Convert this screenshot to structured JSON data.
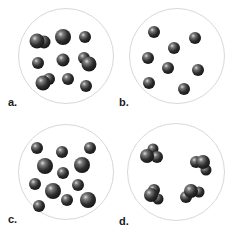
{
  "figure": {
    "colors": {
      "circle_border": "#d8d8d8",
      "atom_dark": "#1e1e1e",
      "atom_mid": "#555555",
      "atom_highlight": "#d9d9d9",
      "label": "#1a1a1a"
    },
    "panels": [
      {
        "id": "a",
        "label": "a.",
        "content": "mixture of single atoms and diatomic molecules",
        "circle": {
          "cx": 66,
          "cy": 56,
          "r": 48
        },
        "label_pos": {
          "x": 8,
          "y": 97
        },
        "particles": [
          {
            "x": 44,
            "y": 42,
            "r": 6.5
          },
          {
            "x": 37,
            "y": 41,
            "r": 7.5
          },
          {
            "x": 63,
            "y": 37,
            "r": 8
          },
          {
            "x": 85,
            "y": 37,
            "r": 6
          },
          {
            "x": 38,
            "y": 63,
            "r": 6
          },
          {
            "x": 63,
            "y": 60,
            "r": 6.5
          },
          {
            "x": 84,
            "y": 58,
            "r": 6
          },
          {
            "x": 89,
            "y": 64,
            "r": 7.5
          },
          {
            "x": 49,
            "y": 79,
            "r": 6
          },
          {
            "x": 43,
            "y": 83,
            "r": 7.5
          },
          {
            "x": 68,
            "y": 79,
            "r": 6
          },
          {
            "x": 86,
            "y": 86,
            "r": 6
          }
        ]
      },
      {
        "id": "b",
        "label": "b.",
        "content": "single atoms of one element",
        "circle": {
          "cx": 177,
          "cy": 56,
          "r": 48
        },
        "label_pos": {
          "x": 119,
          "y": 97
        },
        "particles": [
          {
            "x": 154,
            "y": 32,
            "r": 6
          },
          {
            "x": 195,
            "y": 38,
            "r": 6
          },
          {
            "x": 174,
            "y": 48,
            "r": 6
          },
          {
            "x": 148,
            "y": 58,
            "r": 6
          },
          {
            "x": 168,
            "y": 68,
            "r": 6
          },
          {
            "x": 198,
            "y": 70,
            "r": 6
          },
          {
            "x": 149,
            "y": 83,
            "r": 6
          },
          {
            "x": 184,
            "y": 89,
            "r": 6
          }
        ]
      },
      {
        "id": "c",
        "label": "c.",
        "content": "mixture of two kinds of single atoms",
        "circle": {
          "cx": 66,
          "cy": 172,
          "r": 48
        },
        "label_pos": {
          "x": 8,
          "y": 214
        },
        "particles": [
          {
            "x": 37,
            "y": 148,
            "r": 6
          },
          {
            "x": 62,
            "y": 152,
            "r": 6
          },
          {
            "x": 90,
            "y": 148,
            "r": 6
          },
          {
            "x": 45,
            "y": 166,
            "r": 8
          },
          {
            "x": 82,
            "y": 165,
            "r": 8
          },
          {
            "x": 63,
            "y": 173,
            "r": 6
          },
          {
            "x": 35,
            "y": 184,
            "r": 6
          },
          {
            "x": 78,
            "y": 185,
            "r": 6
          },
          {
            "x": 53,
            "y": 191,
            "r": 8
          },
          {
            "x": 67,
            "y": 200,
            "r": 6
          },
          {
            "x": 88,
            "y": 200,
            "r": 8
          },
          {
            "x": 39,
            "y": 206,
            "r": 6
          }
        ]
      },
      {
        "id": "d",
        "label": "d.",
        "content": "compound molecules (polyatomic clusters)",
        "circle": {
          "cx": 176,
          "cy": 172,
          "r": 49
        },
        "label_pos": {
          "x": 119,
          "y": 216
        },
        "molecules": [
          {
            "x": 150,
            "y": 155,
            "atoms": [
              {
                "dx": 3,
                "dy": -6,
                "r": 5.5
              },
              {
                "dx": 7,
                "dy": 2,
                "r": 6
              },
              {
                "dx": -3,
                "dy": 1,
                "r": 7
              }
            ]
          },
          {
            "x": 201,
            "y": 163,
            "atoms": [
              {
                "dx": 5,
                "dy": 7,
                "r": 5.5
              },
              {
                "dx": -5,
                "dy": -1,
                "r": 6
              },
              {
                "dx": 2,
                "dy": -1,
                "r": 7
              }
            ]
          },
          {
            "x": 152,
            "y": 194,
            "atoms": [
              {
                "dx": 6,
                "dy": 5,
                "r": 5.5
              },
              {
                "dx": 2,
                "dy": -4,
                "r": 6
              },
              {
                "dx": -1,
                "dy": 1,
                "r": 7
              }
            ]
          },
          {
            "x": 191,
            "y": 193,
            "atoms": [
              {
                "dx": 8,
                "dy": -1,
                "r": 5.5
              },
              {
                "dx": -5,
                "dy": 4,
                "r": 6
              },
              {
                "dx": 0,
                "dy": -2,
                "r": 7
              }
            ]
          }
        ]
      }
    ]
  }
}
